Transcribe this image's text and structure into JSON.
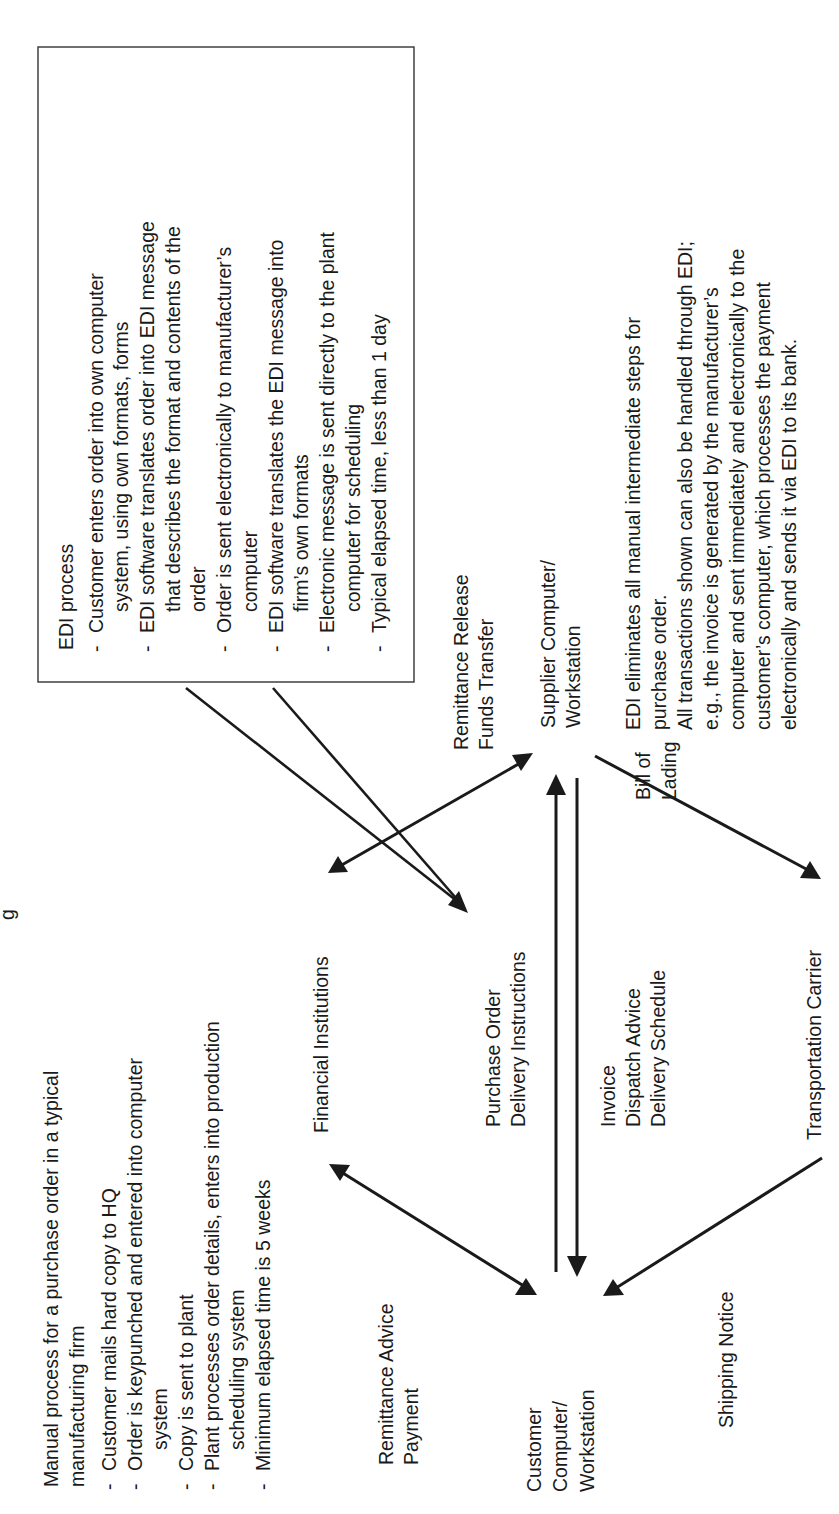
{
  "diagram": {
    "orientation": "rotated 90° counter-clockwise",
    "title_partial": "g",
    "nodes": {
      "financial": "Financial Institutions",
      "supplier": [
        "Supplier Computer/",
        "Workstation"
      ],
      "customer": [
        "Customer",
        "Computer/",
        "Workstation"
      ],
      "carrier": "Transportation Carrier"
    },
    "edge_labels": {
      "remittance_release": [
        "Remittance Release",
        "Funds Transfer"
      ],
      "remittance_advice": [
        "Remittance Advice",
        "Payment"
      ],
      "purchase_order": [
        "Purchase Order",
        "Delivery Instructions"
      ],
      "invoice": [
        "Invoice",
        "Dispatch Advice",
        "Delivery Schedule"
      ],
      "bill_of_lading": [
        "Bill of",
        "Lading"
      ],
      "shipping_notice": "Shipping Notice"
    },
    "manual_process": {
      "heading": [
        "Manual process for a purchase order in a typical",
        "manufacturing firm"
      ],
      "bullet_char": "-",
      "bullets": [
        [
          "Customer mails hard copy to HQ"
        ],
        [
          "Order is keypunched and entered into computer",
          "system"
        ],
        [
          "Copy is sent to plant"
        ],
        [
          "Plant processes order details, enters into production",
          "scheduling system"
        ],
        [
          "Minimum elapsed time is 5 weeks"
        ]
      ]
    },
    "edi_process": {
      "heading": "EDI process",
      "bullet_char": "-",
      "bullets": [
        [
          "Customer enters order into own computer",
          "system, using own formats, forms"
        ],
        [
          "EDI software translates order into EDI message",
          "that describes the format and contents of the",
          "order"
        ],
        [
          "Order is sent electronically to manufacturer’s",
          "computer"
        ],
        [
          "EDI software translates the EDI message into",
          "firm’s own formats"
        ],
        [
          "Electronic message is sent directly to the plant",
          "computer for scheduling"
        ],
        [
          "Typical elapsed time, less than 1 day"
        ]
      ]
    },
    "edi_note": [
      "EDI eliminates all manual intermediate steps for",
      "purchase order.",
      "All transactions shown can also be handled through EDI;",
      "e.g., the invoice is generated by the manufacturer’s",
      "computer and sent immediately and electronically to the",
      "customer’s computer, which processes the payment",
      "electronically and sends it via EDI to its bank."
    ],
    "colors": {
      "ink": "#1a1a1a",
      "box_border": "#333333",
      "background": "#ffffff"
    }
  }
}
